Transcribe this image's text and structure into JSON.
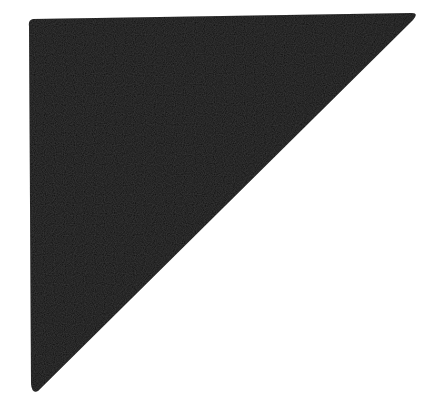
{
  "figure": {
    "shape": "right-triangle",
    "fill_color": "#0d0d0d",
    "background_color": "#ffffff",
    "vertices": [
      [
        29,
        20
      ],
      [
        416,
        13
      ],
      [
        36,
        392
      ]
    ]
  }
}
